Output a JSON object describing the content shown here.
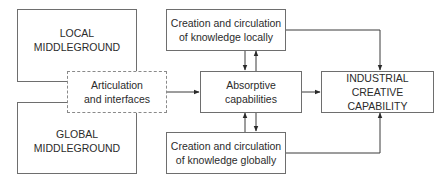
{
  "diagram": {
    "nodes": {
      "local_middleground": {
        "label": "LOCAL\nMIDDLEGROUND"
      },
      "global_middleground": {
        "label": "GLOBAL\nMIDDLEGROUND"
      },
      "articulation": {
        "label": "Articulation\nand interfaces",
        "style": "dashed"
      },
      "creation_local": {
        "label": "Creation and circulation\nof knowledge locally"
      },
      "absorptive": {
        "label": "Absorptive\ncapabilities"
      },
      "creation_global": {
        "label": "Creation and circulation\nof knowledge globally"
      },
      "industrial": {
        "label": "INDUSTRIAL\nCREATIVE CAPABILITY"
      }
    },
    "edges": [
      {
        "from": "articulation",
        "to": "absorptive"
      },
      {
        "from": "creation_local",
        "to": "absorptive"
      },
      {
        "from": "absorptive",
        "to": "creation_local"
      },
      {
        "from": "creation_global",
        "to": "absorptive"
      },
      {
        "from": "absorptive",
        "to": "creation_global"
      },
      {
        "from": "absorptive",
        "to": "industrial"
      },
      {
        "from": "creation_local",
        "to": "industrial"
      },
      {
        "from": "creation_global",
        "to": "industrial"
      }
    ],
    "colors": {
      "line": "#3a3a3a",
      "border": "#6e6e6e",
      "text": "#2b2b2b"
    }
  }
}
